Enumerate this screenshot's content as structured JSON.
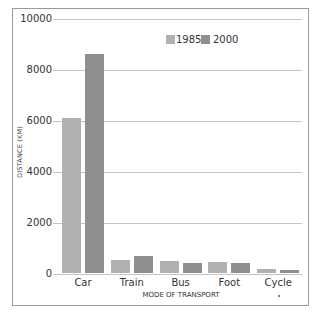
{
  "chart_data": {
    "type": "bar",
    "title": "",
    "xlabel": "MODE OF TRANSPORT",
    "ylabel": "DISTANCE (KM)",
    "categories": [
      "Car",
      "Train",
      "Bus",
      "Foot",
      "Cycle"
    ],
    "series": [
      {
        "name": "1985",
        "color": "#b1b1b1",
        "values": [
          6100,
          540,
          510,
          460,
          190
        ]
      },
      {
        "name": "2000",
        "color": "#8f8f8f",
        "values": [
          8640,
          700,
          400,
          400,
          150
        ]
      }
    ],
    "ylim": [
      0,
      10000
    ],
    "yticks": [
      0,
      2000,
      4000,
      6000,
      8000,
      10000
    ],
    "ytick_labels": [
      "0",
      "2000",
      "4000",
      "6000",
      "8000",
      "10000"
    ],
    "grid": true,
    "legend_position": "top-center-inside"
  },
  "legend": {
    "items": [
      {
        "label": "1985",
        "color": "#b1b1b1"
      },
      {
        "label": "2000",
        "color": "#8f8f8f"
      }
    ]
  },
  "axes": {
    "x_label": "MODE OF TRANSPORT",
    "y_label": "DISTANCE (KM)",
    "ytick_labels": [
      "0",
      "2000",
      "4000",
      "6000",
      "8000",
      "10000"
    ],
    "categories": [
      "Car",
      "Train",
      "Bus",
      "Foot",
      "Cycle"
    ]
  }
}
